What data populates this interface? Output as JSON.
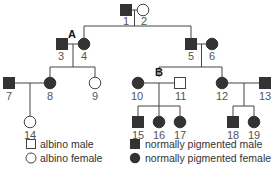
{
  "pedigree": {
    "colors": {
      "affected_fill": "#333333",
      "line": "#444444",
      "open_fill": "#ffffff"
    },
    "markers": {
      "A": "A",
      "B": "B"
    },
    "individuals": [
      {
        "id": "1",
        "sex": "male",
        "phenotype": "normally pigmented"
      },
      {
        "id": "2",
        "sex": "female",
        "phenotype": "albino"
      },
      {
        "id": "3",
        "sex": "male",
        "phenotype": "normally pigmented"
      },
      {
        "id": "4",
        "sex": "female",
        "phenotype": "normally pigmented"
      },
      {
        "id": "5",
        "sex": "male",
        "phenotype": "normally pigmented"
      },
      {
        "id": "6",
        "sex": "female",
        "phenotype": "normally pigmented"
      },
      {
        "id": "7",
        "sex": "male",
        "phenotype": "normally pigmented"
      },
      {
        "id": "8",
        "sex": "female",
        "phenotype": "normally pigmented"
      },
      {
        "id": "9",
        "sex": "female",
        "phenotype": "albino"
      },
      {
        "id": "10",
        "sex": "female",
        "phenotype": "normally pigmented"
      },
      {
        "id": "11",
        "sex": "male",
        "phenotype": "albino"
      },
      {
        "id": "12",
        "sex": "female",
        "phenotype": "normally pigmented"
      },
      {
        "id": "13",
        "sex": "male",
        "phenotype": "normally pigmented"
      },
      {
        "id": "14",
        "sex": "female",
        "phenotype": "albino"
      },
      {
        "id": "15",
        "sex": "male",
        "phenotype": "normally pigmented"
      },
      {
        "id": "16",
        "sex": "female",
        "phenotype": "normally pigmented"
      },
      {
        "id": "17",
        "sex": "female",
        "phenotype": "normally pigmented"
      },
      {
        "id": "18",
        "sex": "male",
        "phenotype": "normally pigmented"
      },
      {
        "id": "19",
        "sex": "female",
        "phenotype": "normally pigmented"
      }
    ],
    "labels": {
      "i1": "1",
      "i2": "2",
      "i3": "3",
      "i4": "4",
      "i5": "5",
      "i6": "6",
      "i7": "7",
      "i8": "8",
      "i9": "9",
      "i10": "10",
      "i11": "11",
      "i12": "12",
      "i13": "13",
      "i14": "14",
      "i15": "15",
      "i16": "16",
      "i17": "17",
      "i18": "18",
      "i19": "19"
    }
  },
  "legend": {
    "albino_male": "albino male",
    "albino_female": "albino female",
    "pigmented_male": "normally pigmented male",
    "pigmented_female": "normally pigmented female"
  }
}
